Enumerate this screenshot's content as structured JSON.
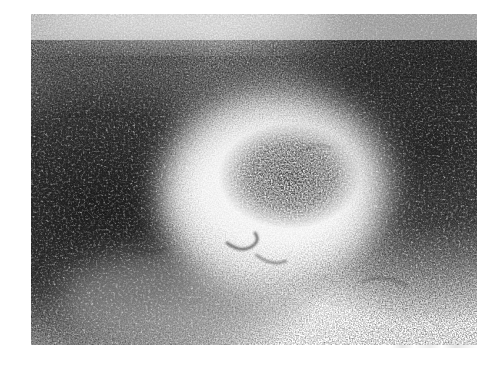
{
  "page": {
    "background_color": "#ffffff",
    "width": 504,
    "height": 368,
    "caption": ""
  },
  "figure": {
    "name": "histology-micrograph",
    "kind": "photomicrograph",
    "stain_appearance": "monochrome halftone print, dark stippled nuclei on light background",
    "plate": {
      "left": 31,
      "top": 14,
      "width": 446,
      "height": 331,
      "border": "none",
      "paper_color": "#ffffff",
      "ink_color": "#1c1c1c"
    },
    "regions": [
      {
        "name": "germinal-center",
        "label": "pale central follicle",
        "center_x": 0.55,
        "center_y": 0.52,
        "radius_x": 0.24,
        "radius_y": 0.28,
        "density": 0.22
      },
      {
        "name": "germinal-center-dark-core",
        "label": "darker cell cluster within follicle",
        "center_x": 0.58,
        "center_y": 0.49,
        "radius_x": 0.13,
        "radius_y": 0.15,
        "density": 0.5
      },
      {
        "name": "mantle-zone-left",
        "label": "dense dark lymphocyte zone, left",
        "center_x": 0.18,
        "center_y": 0.58,
        "radius_x": 0.3,
        "radius_y": 0.42,
        "density": 0.88
      },
      {
        "name": "mantle-zone-right",
        "label": "dense dark lymphocyte zone, right",
        "center_x": 0.86,
        "center_y": 0.4,
        "radius_x": 0.26,
        "radius_y": 0.46,
        "density": 0.85
      },
      {
        "name": "upper-pale-band",
        "label": "lighter band along upper margin",
        "center_x": 0.42,
        "center_y": 0.04,
        "radius_x": 0.45,
        "radius_y": 0.09,
        "density": 0.18
      },
      {
        "name": "lower-left-pale-streak",
        "label": "lighter streak, lower left",
        "center_x": 0.3,
        "center_y": 0.86,
        "radius_x": 0.22,
        "radius_y": 0.12,
        "density": 0.45
      }
    ],
    "artifacts": [
      {
        "name": "scan-smudge",
        "label": "faint scanner streak below plate",
        "left": 392,
        "top": 344,
        "width": 86,
        "height": 4
      }
    ],
    "text_overlays": [],
    "scale_bar": null,
    "magnification_label": null
  }
}
